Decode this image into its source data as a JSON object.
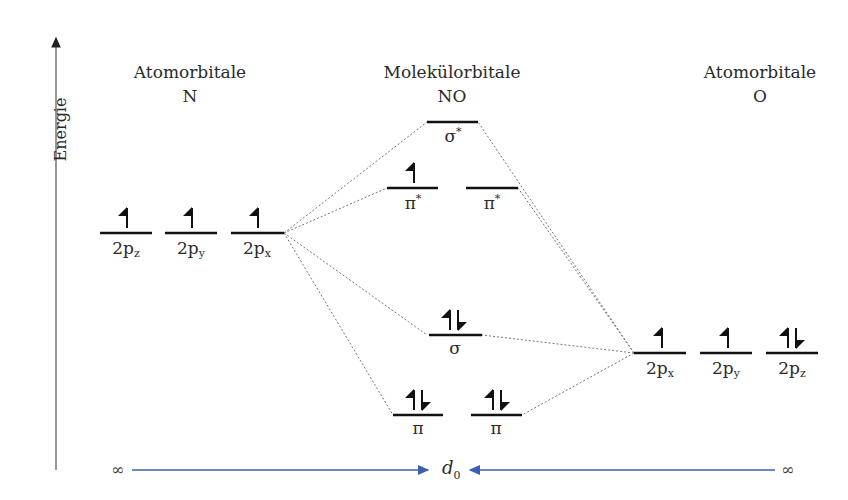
{
  "axis": {
    "label": "Energie"
  },
  "columns": {
    "left": {
      "title": "Atomorbitale",
      "atom": "N"
    },
    "center": {
      "title": "Molekülorbitale",
      "atom": "NO"
    },
    "right": {
      "title": "Atomorbitale",
      "atom": "O"
    }
  },
  "orbitals": {
    "N": [
      {
        "label": "2p",
        "sub": "z",
        "electrons": 1
      },
      {
        "label": "2p",
        "sub": "y",
        "electrons": 1
      },
      {
        "label": "2p",
        "sub": "x",
        "electrons": 1
      }
    ],
    "O": [
      {
        "label": "2p",
        "sub": "x",
        "electrons": 1
      },
      {
        "label": "2p",
        "sub": "y",
        "electrons": 1
      },
      {
        "label": "2p",
        "sub": "z",
        "electrons": 2
      }
    ],
    "NO": [
      {
        "label": "σ",
        "sup": "*",
        "electrons": 0
      },
      {
        "label": "π",
        "sup": "*",
        "electrons": 1
      },
      {
        "label": "π",
        "sup": "*",
        "electrons": 0
      },
      {
        "label": "σ",
        "sup": "",
        "electrons": 2
      },
      {
        "label": "π",
        "sup": "",
        "electrons": 2
      },
      {
        "label": "π",
        "sup": "",
        "electrons": 2
      }
    ]
  },
  "distance_axis": {
    "left": "∞",
    "center": "d",
    "center_sub": "0",
    "right": "∞",
    "arrow_color": "#3a5fb0"
  }
}
